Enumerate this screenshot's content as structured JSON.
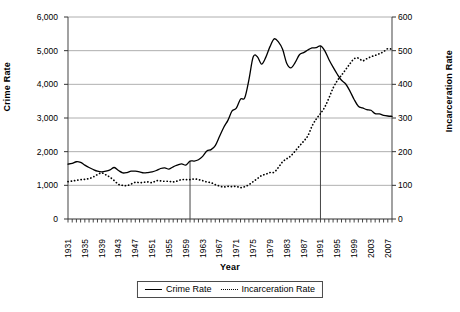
{
  "chart_data": {
    "type": "line",
    "title": "",
    "xlabel": "Year",
    "ylabel": "Crime Rate",
    "ylabel_secondary": "Incarceration Rate",
    "grid": true,
    "legend_position": "bottom",
    "xlim": [
      1931,
      2008
    ],
    "ylim": [
      0,
      6000
    ],
    "ylim_secondary": [
      0,
      600
    ],
    "y_ticks": [
      "0",
      "1,000",
      "2,000",
      "3,000",
      "4,000",
      "5,000",
      "6,000"
    ],
    "y_ticks_secondary": [
      "0",
      "100",
      "200",
      "300",
      "400",
      "500",
      "600"
    ],
    "x_tick_labels": [
      "1931",
      "1935",
      "1939",
      "1943",
      "1947",
      "1951",
      "1955",
      "1959",
      "1963",
      "1967",
      "1971",
      "1975",
      "1979",
      "1983",
      "1987",
      "1991",
      "1995",
      "1999",
      "2003",
      "2007"
    ],
    "x_tick_step": 4,
    "annotations": [
      {
        "name": "reference-line-1960",
        "x": 1960
      },
      {
        "name": "reference-line-1991",
        "x": 1991
      }
    ],
    "series": [
      {
        "name": "Crime Rate",
        "axis": "left",
        "style": "solid",
        "x": [
          1931,
          1932,
          1933,
          1934,
          1935,
          1936,
          1937,
          1938,
          1939,
          1940,
          1941,
          1942,
          1943,
          1944,
          1945,
          1946,
          1947,
          1948,
          1949,
          1950,
          1951,
          1952,
          1953,
          1954,
          1955,
          1956,
          1957,
          1958,
          1959,
          1960,
          1961,
          1962,
          1963,
          1964,
          1965,
          1966,
          1967,
          1968,
          1969,
          1970,
          1971,
          1972,
          1973,
          1974,
          1975,
          1976,
          1977,
          1978,
          1979,
          1980,
          1981,
          1982,
          1983,
          1984,
          1985,
          1986,
          1987,
          1988,
          1989,
          1990,
          1991,
          1992,
          1993,
          1994,
          1995,
          1996,
          1997,
          1998,
          1999,
          2000,
          2001,
          2002,
          2003,
          2004,
          2005,
          2006,
          2007,
          2008
        ],
        "values": [
          1630,
          1650,
          1700,
          1680,
          1600,
          1530,
          1470,
          1420,
          1400,
          1420,
          1460,
          1530,
          1440,
          1370,
          1380,
          1420,
          1420,
          1400,
          1370,
          1380,
          1400,
          1440,
          1500,
          1520,
          1480,
          1550,
          1600,
          1640,
          1600,
          1720,
          1720,
          1760,
          1860,
          2020,
          2060,
          2180,
          2450,
          2720,
          2930,
          3210,
          3290,
          3560,
          3600,
          4140,
          4810,
          4820,
          4600,
          4800,
          5120,
          5350,
          5260,
          5040,
          4620,
          4490,
          4650,
          4880,
          4940,
          5020,
          5080,
          5090,
          5140,
          5000,
          4740,
          4510,
          4300,
          4120,
          4010,
          3800,
          3550,
          3350,
          3300,
          3250,
          3230,
          3130,
          3120,
          3080,
          3060,
          3050
        ]
      },
      {
        "name": "Incarceration Rate",
        "axis": "right",
        "style": "dotted",
        "x": [
          1931,
          1932,
          1933,
          1934,
          1935,
          1936,
          1937,
          1938,
          1939,
          1940,
          1941,
          1942,
          1943,
          1944,
          1945,
          1946,
          1947,
          1948,
          1949,
          1950,
          1951,
          1952,
          1953,
          1954,
          1955,
          1956,
          1957,
          1958,
          1959,
          1960,
          1961,
          1962,
          1963,
          1964,
          1965,
          1966,
          1967,
          1968,
          1969,
          1970,
          1971,
          1972,
          1973,
          1974,
          1975,
          1976,
          1977,
          1978,
          1979,
          1980,
          1981,
          1982,
          1983,
          1984,
          1985,
          1986,
          1987,
          1988,
          1989,
          1990,
          1991,
          1992,
          1993,
          1994,
          1995,
          1996,
          1997,
          1998,
          1999,
          2000,
          2001,
          2002,
          2003,
          2004,
          2005,
          2006,
          2007,
          2008
        ],
        "values": [
          111,
          113,
          115,
          117,
          118,
          120,
          125,
          132,
          137,
          131,
          124,
          114,
          103,
          100,
          99,
          104,
          109,
          108,
          109,
          110,
          108,
          114,
          113,
          112,
          112,
          110,
          113,
          117,
          117,
          117,
          119,
          117,
          114,
          110,
          108,
          102,
          98,
          95,
          97,
          96,
          97,
          93,
          96,
          102,
          111,
          120,
          129,
          133,
          138,
          139,
          153,
          170,
          179,
          188,
          202,
          217,
          231,
          247,
          276,
          297,
          313,
          332,
          359,
          389,
          411,
          427,
          444,
          461,
          476,
          478,
          470,
          476,
          482,
          486,
          491,
          497,
          506,
          504
        ]
      }
    ]
  },
  "legend": {
    "items": [
      {
        "label": "Crime Rate",
        "style": "solid"
      },
      {
        "label": "Incarceration Rate",
        "style": "dotted"
      }
    ]
  }
}
